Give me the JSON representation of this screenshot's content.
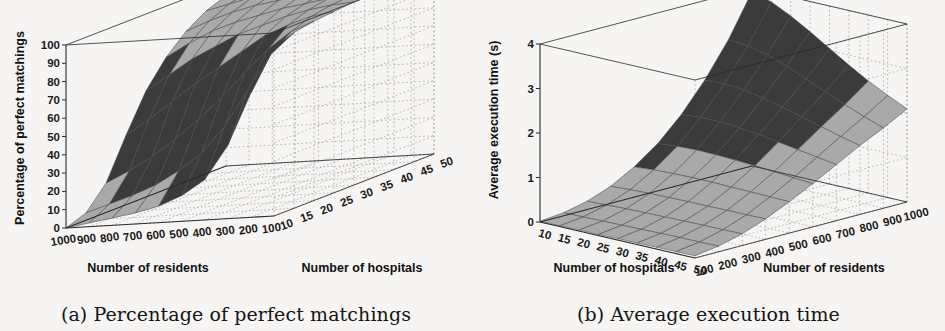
{
  "figure": {
    "background_color": "#f6f5f3",
    "surface_light_color": "#a9a9a9",
    "surface_dark_color": "#3b3b3b",
    "mesh_line_color": "#4a4a4a",
    "grid_color": "#9a9a9a",
    "axis_color": "#2b2b2b"
  },
  "panels": [
    {
      "id": "a",
      "caption": "(a) Percentage of perfect matchings",
      "zlabel": "Percentage of perfect matchings",
      "xlabel": "Number of residents",
      "ylabel": "Number of hospitals",
      "zticks": [
        "0",
        "10",
        "20",
        "30",
        "40",
        "50",
        "60",
        "70",
        "80",
        "90",
        "100"
      ],
      "xticks": [
        "1000",
        "900",
        "800",
        "700",
        "600",
        "500",
        "400",
        "300",
        "200",
        "100"
      ],
      "yticks": [
        "10",
        "15",
        "20",
        "25",
        "30",
        "35",
        "40",
        "45",
        "50"
      ]
    },
    {
      "id": "b",
      "caption": "(b) Average execution time",
      "zlabel": "Average execution time (s)",
      "xlabel": "Number of hospitals",
      "ylabel": "Number of residents",
      "zticks": [
        "0",
        "1",
        "2",
        "3",
        "4"
      ],
      "xticks": [
        "10",
        "15",
        "20",
        "25",
        "30",
        "35",
        "40",
        "45",
        "50"
      ],
      "yticks": [
        "100",
        "200",
        "300",
        "400",
        "500",
        "600",
        "700",
        "800",
        "900",
        "1000"
      ]
    }
  ],
  "chart_data": [
    {
      "type": "surface",
      "panel": "a",
      "title": "(a) Percentage of perfect matchings",
      "xlabel": "Number of residents",
      "ylabel": "Number of hospitals",
      "zlabel": "Percentage of perfect matchings",
      "x": [
        1000,
        900,
        800,
        700,
        600,
        500,
        400,
        300,
        200,
        100
      ],
      "y": [
        10,
        15,
        20,
        25,
        30,
        35,
        40,
        45,
        50
      ],
      "zlim": [
        0,
        100
      ],
      "grid": true,
      "legend": "none",
      "note": "z[i][j] = percentage for y=hospitals[i], x=residents[j]; rises to 100% as residents decrease and hospitals increase",
      "z": [
        [
          0,
          2,
          4,
          6,
          9,
          14,
          22,
          40,
          68,
          92
        ],
        [
          4,
          8,
          12,
          17,
          24,
          33,
          47,
          66,
          85,
          96
        ],
        [
          16,
          22,
          29,
          38,
          48,
          59,
          72,
          84,
          93,
          98
        ],
        [
          38,
          46,
          55,
          64,
          72,
          80,
          88,
          93,
          97,
          99
        ],
        [
          58,
          66,
          74,
          80,
          86,
          90,
          94,
          97,
          99,
          100
        ],
        [
          72,
          79,
          85,
          89,
          92,
          95,
          97,
          99,
          100,
          100
        ],
        [
          82,
          87,
          91,
          94,
          96,
          98,
          99,
          100,
          100,
          100
        ],
        [
          89,
          92,
          95,
          97,
          98,
          99,
          100,
          100,
          100,
          100
        ],
        [
          93,
          95,
          97,
          98,
          99,
          100,
          100,
          100,
          100,
          100
        ]
      ]
    },
    {
      "type": "surface",
      "panel": "b",
      "title": "(b) Average execution time",
      "xlabel": "Number of hospitals",
      "ylabel": "Number of residents",
      "zlabel": "Average execution time (s)",
      "x": [
        10,
        15,
        20,
        25,
        30,
        35,
        40,
        45,
        50
      ],
      "y": [
        100,
        200,
        300,
        400,
        500,
        600,
        700,
        800,
        900,
        1000
      ],
      "zlim": [
        0,
        4.7
      ],
      "grid": true,
      "legend": "none",
      "note": "z[i][j] = seconds for y=residents[i], x=hospitals[j]; peak ~4.6 s at 1000 residents / 10 hospitals",
      "z": [
        [
          0.02,
          0.02,
          0.03,
          0.03,
          0.04,
          0.04,
          0.05,
          0.05,
          0.06
        ],
        [
          0.08,
          0.09,
          0.1,
          0.11,
          0.12,
          0.13,
          0.14,
          0.14,
          0.15
        ],
        [
          0.22,
          0.24,
          0.26,
          0.27,
          0.28,
          0.29,
          0.3,
          0.3,
          0.31
        ],
        [
          0.45,
          0.48,
          0.5,
          0.51,
          0.52,
          0.52,
          0.53,
          0.53,
          0.54
        ],
        [
          0.8,
          0.84,
          0.86,
          0.87,
          0.87,
          0.86,
          0.85,
          0.84,
          0.83
        ],
        [
          1.25,
          1.3,
          1.32,
          1.31,
          1.29,
          1.26,
          1.22,
          1.18,
          1.14
        ],
        [
          1.85,
          1.9,
          1.9,
          1.86,
          1.8,
          1.72,
          1.64,
          1.56,
          1.48
        ],
        [
          2.6,
          2.62,
          2.58,
          2.48,
          2.36,
          2.22,
          2.08,
          1.94,
          1.82
        ],
        [
          3.5,
          3.46,
          3.34,
          3.16,
          2.94,
          2.72,
          2.5,
          2.3,
          2.12
        ],
        [
          4.6,
          4.45,
          4.2,
          3.9,
          3.58,
          3.26,
          2.96,
          2.7,
          2.46
        ]
      ]
    }
  ]
}
